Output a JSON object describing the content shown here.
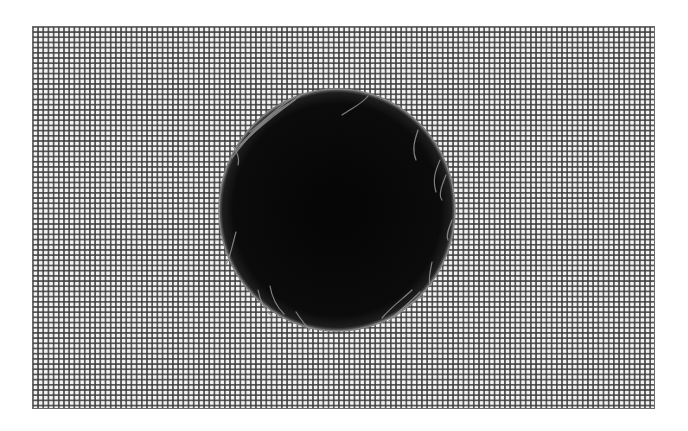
{
  "scene": {
    "description": "Black circular disk resting on a fine square wire mesh",
    "background_color": "#ffffff",
    "mesh": {
      "x": 32,
      "y": 26,
      "width": 623,
      "height": 383,
      "pitch_px": 5.2,
      "line_color": "#3c3c3c",
      "cell_color": "#f2f2f2"
    },
    "disk": {
      "cx": 337,
      "cy": 210,
      "rx": 118,
      "ry": 121,
      "fill_color": "#0a0a0a",
      "rim_color": "#7a7a7a",
      "fiber_color": "#8c8c8c"
    }
  }
}
